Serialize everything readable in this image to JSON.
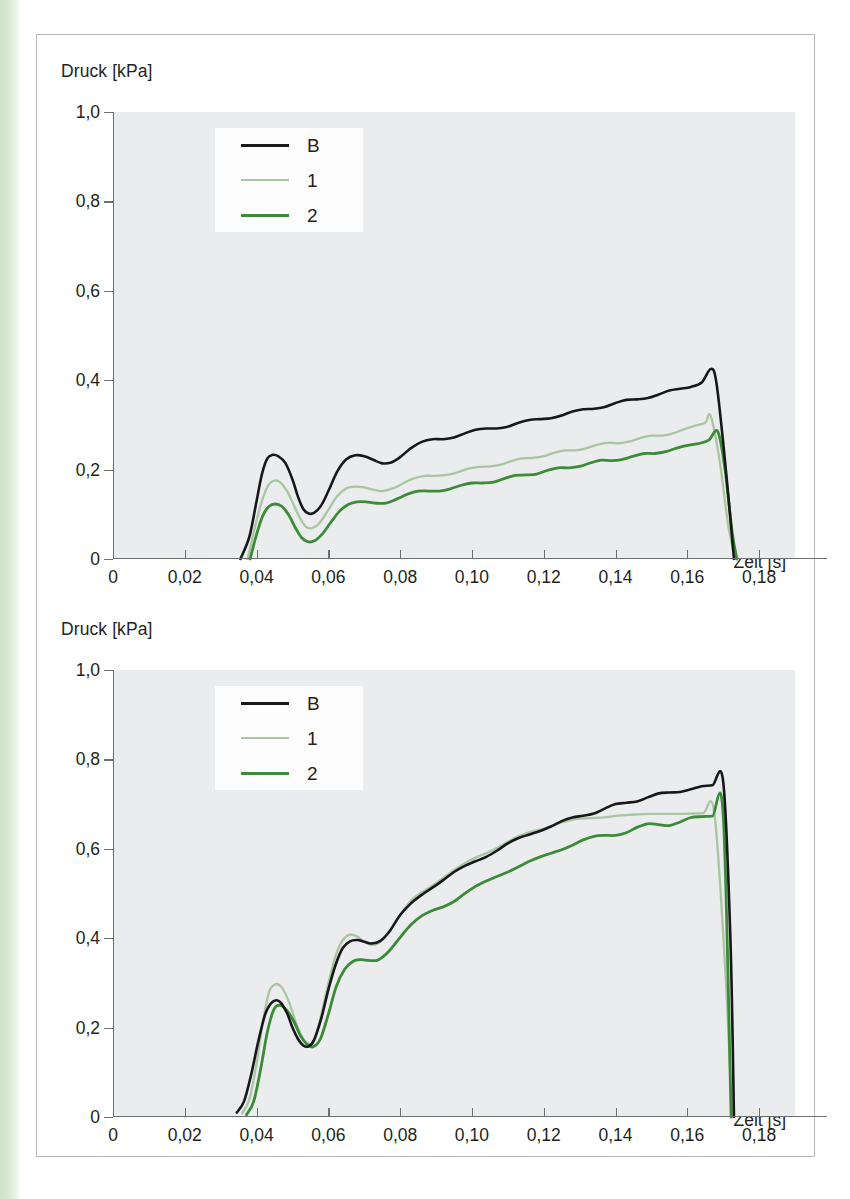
{
  "page": {
    "accent_stripe_color": "#d6e5d0",
    "frame_border_color": "#b9b9b9",
    "plot_background": "#ebeced",
    "axis_color": "#6d6e70"
  },
  "charts": [
    {
      "id": "top",
      "ylabel": "Druck [kPa]",
      "xlabel": "Zeit [s]",
      "y_ticks": [
        "1,0",
        "0,8",
        "0,6",
        "0,4",
        "0,2",
        "0"
      ],
      "x_ticks": [
        "0",
        "0,02",
        "0,04",
        "0,06",
        "0,08",
        "0,10",
        "0,12",
        "0,14",
        "0,16",
        "0,18"
      ],
      "legend": [
        {
          "label": "B",
          "color": "#17181a",
          "style": "solid"
        },
        {
          "label": "1",
          "color": "#a9c5a2",
          "style": "solid-light"
        },
        {
          "label": "2",
          "color": "#3c8b38",
          "style": "solid"
        }
      ]
    },
    {
      "id": "bottom",
      "ylabel": "Druck [kPa]",
      "xlabel": "Zeit [s]",
      "y_ticks": [
        "1,0",
        "0,8",
        "0,6",
        "0,4",
        "0,2",
        "0"
      ],
      "x_ticks": [
        "0",
        "0,02",
        "0,04",
        "0,06",
        "0,08",
        "0,10",
        "0,12",
        "0,14",
        "0,16",
        "0,18"
      ],
      "legend": [
        {
          "label": "B",
          "color": "#17181a",
          "style": "solid"
        },
        {
          "label": "1",
          "color": "#a9c5a2",
          "style": "solid-light"
        },
        {
          "label": "2",
          "color": "#3c8b38",
          "style": "solid"
        }
      ]
    }
  ],
  "chart_data": [
    {
      "type": "line",
      "id": "top",
      "title": "",
      "xlabel": "Zeit [s]",
      "ylabel": "Druck [kPa]",
      "xlim": [
        0,
        0.19
      ],
      "ylim": [
        0,
        1.0
      ],
      "xticks": [
        0,
        0.02,
        0.04,
        0.06,
        0.08,
        0.1,
        0.12,
        0.14,
        0.16,
        0.18
      ],
      "yticks": [
        0,
        0.2,
        0.4,
        0.6,
        0.8,
        1.0
      ],
      "grid": false,
      "legend_position": "upper-left-inside",
      "series": [
        {
          "name": "B",
          "color": "#17181a",
          "x": [
            0.0355,
            0.038,
            0.04,
            0.0415,
            0.043,
            0.0445,
            0.046,
            0.048,
            0.05,
            0.0515,
            0.053,
            0.0545,
            0.056,
            0.058,
            0.06,
            0.0625,
            0.065,
            0.0675,
            0.07,
            0.0725,
            0.075,
            0.0775,
            0.08,
            0.083,
            0.086,
            0.089,
            0.092,
            0.095,
            0.098,
            0.101,
            0.104,
            0.107,
            0.11,
            0.113,
            0.116,
            0.119,
            0.122,
            0.125,
            0.128,
            0.131,
            0.134,
            0.137,
            0.14,
            0.143,
            0.146,
            0.149,
            0.152,
            0.155,
            0.158,
            0.161,
            0.164,
            0.1665,
            0.168,
            0.17,
            0.172,
            0.173
          ],
          "y": [
            0.0,
            0.05,
            0.13,
            0.19,
            0.225,
            0.233,
            0.23,
            0.215,
            0.178,
            0.14,
            0.112,
            0.102,
            0.103,
            0.12,
            0.152,
            0.196,
            0.223,
            0.232,
            0.23,
            0.222,
            0.214,
            0.216,
            0.228,
            0.248,
            0.262,
            0.268,
            0.268,
            0.272,
            0.281,
            0.289,
            0.292,
            0.292,
            0.296,
            0.305,
            0.311,
            0.313,
            0.315,
            0.321,
            0.33,
            0.335,
            0.336,
            0.34,
            0.349,
            0.356,
            0.357,
            0.36,
            0.368,
            0.377,
            0.381,
            0.385,
            0.395,
            0.425,
            0.4,
            0.26,
            0.09,
            0.0
          ]
        },
        {
          "name": "1",
          "color": "#a9c5a2",
          "x": [
            0.0375,
            0.0395,
            0.0415,
            0.0432,
            0.0448,
            0.0465,
            0.0485,
            0.0505,
            0.0522,
            0.0538,
            0.0555,
            0.0575,
            0.06,
            0.0625,
            0.065,
            0.0675,
            0.07,
            0.0725,
            0.075,
            0.078,
            0.081,
            0.084,
            0.087,
            0.09,
            0.093,
            0.096,
            0.099,
            0.102,
            0.105,
            0.108,
            0.111,
            0.114,
            0.117,
            0.12,
            0.123,
            0.126,
            0.129,
            0.132,
            0.135,
            0.138,
            0.141,
            0.144,
            0.147,
            0.15,
            0.153,
            0.156,
            0.159,
            0.162,
            0.165,
            0.1665,
            0.169,
            0.1715,
            0.1735
          ],
          "y": [
            0.0,
            0.07,
            0.13,
            0.164,
            0.175,
            0.172,
            0.152,
            0.118,
            0.09,
            0.072,
            0.069,
            0.08,
            0.11,
            0.141,
            0.158,
            0.162,
            0.16,
            0.155,
            0.152,
            0.158,
            0.17,
            0.181,
            0.186,
            0.186,
            0.188,
            0.194,
            0.202,
            0.206,
            0.207,
            0.211,
            0.219,
            0.225,
            0.226,
            0.23,
            0.238,
            0.243,
            0.243,
            0.248,
            0.256,
            0.26,
            0.259,
            0.263,
            0.271,
            0.276,
            0.276,
            0.281,
            0.29,
            0.298,
            0.305,
            0.32,
            0.22,
            0.07,
            0.0
          ]
        },
        {
          "name": "2",
          "color": "#3c8b38",
          "x": [
            0.0382,
            0.04,
            0.0418,
            0.0435,
            0.0452,
            0.047,
            0.049,
            0.0508,
            0.0525,
            0.0542,
            0.056,
            0.0582,
            0.0605,
            0.063,
            0.0655,
            0.068,
            0.0705,
            0.073,
            0.076,
            0.079,
            0.082,
            0.085,
            0.088,
            0.091,
            0.094,
            0.097,
            0.1,
            0.103,
            0.106,
            0.109,
            0.112,
            0.115,
            0.118,
            0.121,
            0.124,
            0.127,
            0.13,
            0.133,
            0.136,
            0.139,
            0.142,
            0.145,
            0.148,
            0.151,
            0.154,
            0.157,
            0.16,
            0.163,
            0.166,
            0.1685,
            0.1705,
            0.1725,
            0.1738
          ],
          "y": [
            0.0,
            0.055,
            0.098,
            0.118,
            0.123,
            0.118,
            0.098,
            0.07,
            0.048,
            0.039,
            0.04,
            0.055,
            0.08,
            0.106,
            0.122,
            0.128,
            0.128,
            0.125,
            0.125,
            0.134,
            0.145,
            0.152,
            0.152,
            0.152,
            0.157,
            0.165,
            0.17,
            0.17,
            0.172,
            0.18,
            0.187,
            0.188,
            0.19,
            0.198,
            0.204,
            0.204,
            0.207,
            0.215,
            0.221,
            0.22,
            0.223,
            0.23,
            0.236,
            0.236,
            0.24,
            0.248,
            0.254,
            0.258,
            0.266,
            0.285,
            0.2,
            0.06,
            0.0
          ]
        }
      ]
    },
    {
      "type": "line",
      "id": "bottom",
      "title": "",
      "xlabel": "Zeit [s]",
      "ylabel": "Druck [kPa]",
      "xlim": [
        0,
        0.19
      ],
      "ylim": [
        0,
        1.0
      ],
      "xticks": [
        0,
        0.02,
        0.04,
        0.06,
        0.08,
        0.1,
        0.12,
        0.14,
        0.16,
        0.18
      ],
      "yticks": [
        0,
        0.2,
        0.4,
        0.6,
        0.8,
        1.0
      ],
      "grid": false,
      "legend_position": "upper-left-inside",
      "series": [
        {
          "name": "B",
          "color": "#17181a",
          "x": [
            0.0345,
            0.0365,
            0.0385,
            0.0405,
            0.0425,
            0.0445,
            0.0465,
            0.0485,
            0.05,
            0.0515,
            0.053,
            0.0545,
            0.056,
            0.058,
            0.06,
            0.062,
            0.064,
            0.066,
            0.068,
            0.07,
            0.072,
            0.0745,
            0.077,
            0.08,
            0.083,
            0.086,
            0.089,
            0.092,
            0.095,
            0.098,
            0.101,
            0.104,
            0.107,
            0.11,
            0.113,
            0.116,
            0.119,
            0.122,
            0.125,
            0.128,
            0.131,
            0.134,
            0.137,
            0.14,
            0.143,
            0.146,
            0.149,
            0.152,
            0.155,
            0.158,
            0.161,
            0.164,
            0.167,
            0.17,
            0.172,
            0.173
          ],
          "y": [
            0.01,
            0.035,
            0.095,
            0.17,
            0.232,
            0.258,
            0.258,
            0.232,
            0.2,
            0.175,
            0.16,
            0.158,
            0.172,
            0.22,
            0.285,
            0.34,
            0.378,
            0.393,
            0.396,
            0.392,
            0.388,
            0.394,
            0.415,
            0.452,
            0.478,
            0.497,
            0.513,
            0.53,
            0.548,
            0.562,
            0.572,
            0.582,
            0.596,
            0.612,
            0.624,
            0.632,
            0.64,
            0.65,
            0.662,
            0.67,
            0.674,
            0.679,
            0.69,
            0.7,
            0.703,
            0.706,
            0.715,
            0.724,
            0.726,
            0.727,
            0.733,
            0.74,
            0.742,
            0.75,
            0.4,
            0.0
          ]
        },
        {
          "name": "1",
          "color": "#a9c5a2",
          "x": [
            0.036,
            0.038,
            0.04,
            0.0418,
            0.0435,
            0.0452,
            0.047,
            0.049,
            0.0508,
            0.0525,
            0.0542,
            0.056,
            0.058,
            0.06,
            0.062,
            0.064,
            0.066,
            0.068,
            0.07,
            0.072,
            0.0745,
            0.0775,
            0.0805,
            0.0835,
            0.0865,
            0.0895,
            0.0925,
            0.0955,
            0.0985,
            0.1015,
            0.1045,
            0.1075,
            0.1105,
            0.1135,
            0.1165,
            0.1195,
            0.1225,
            0.1255,
            0.1285,
            0.1315,
            0.1345,
            0.1375,
            0.1405,
            0.1435,
            0.1465,
            0.1495,
            0.1525,
            0.1555,
            0.1585,
            0.1615,
            0.1645,
            0.1675,
            0.1705,
            0.1725
          ],
          "y": [
            0.008,
            0.04,
            0.12,
            0.215,
            0.28,
            0.297,
            0.29,
            0.258,
            0.215,
            0.182,
            0.164,
            0.172,
            0.228,
            0.3,
            0.36,
            0.396,
            0.408,
            0.404,
            0.392,
            0.385,
            0.392,
            0.42,
            0.458,
            0.488,
            0.505,
            0.52,
            0.538,
            0.555,
            0.57,
            0.582,
            0.592,
            0.604,
            0.618,
            0.63,
            0.638,
            0.644,
            0.652,
            0.66,
            0.666,
            0.668,
            0.669,
            0.671,
            0.674,
            0.676,
            0.677,
            0.678,
            0.678,
            0.678,
            0.678,
            0.679,
            0.68,
            0.682,
            0.34,
            0.0
          ]
        },
        {
          "name": "2",
          "color": "#3c8b38",
          "x": [
            0.0372,
            0.0392,
            0.0412,
            0.043,
            0.0448,
            0.0465,
            0.0485,
            0.0505,
            0.0522,
            0.054,
            0.0558,
            0.0578,
            0.06,
            0.0622,
            0.0645,
            0.0668,
            0.069,
            0.0715,
            0.074,
            0.077,
            0.08,
            0.083,
            0.086,
            0.089,
            0.092,
            0.095,
            0.098,
            0.101,
            0.104,
            0.107,
            0.11,
            0.113,
            0.116,
            0.119,
            0.122,
            0.125,
            0.128,
            0.131,
            0.134,
            0.137,
            0.14,
            0.143,
            0.146,
            0.149,
            0.152,
            0.155,
            0.158,
            0.161,
            0.164,
            0.167,
            0.17,
            0.1722
          ],
          "y": [
            0.005,
            0.035,
            0.11,
            0.19,
            0.24,
            0.25,
            0.238,
            0.212,
            0.182,
            0.163,
            0.157,
            0.175,
            0.23,
            0.292,
            0.33,
            0.348,
            0.352,
            0.35,
            0.352,
            0.372,
            0.402,
            0.43,
            0.45,
            0.462,
            0.47,
            0.482,
            0.5,
            0.516,
            0.528,
            0.538,
            0.548,
            0.56,
            0.572,
            0.582,
            0.59,
            0.598,
            0.608,
            0.62,
            0.628,
            0.63,
            0.63,
            0.636,
            0.648,
            0.656,
            0.654,
            0.652,
            0.66,
            0.67,
            0.672,
            0.673,
            0.676,
            0.0
          ]
        }
      ]
    }
  ]
}
